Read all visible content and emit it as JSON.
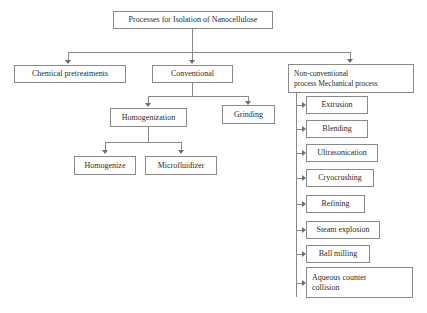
{
  "diagram": {
    "title_node": {
      "label": "Processes for Isolation of Nanocellulose"
    },
    "level2": [
      {
        "label": "Chemical pretreatments"
      },
      {
        "label": "Conventional"
      },
      {
        "label": "Non-conventional\nprocess Mechanical process"
      }
    ],
    "conventional_children": [
      {
        "label": "Homogenization"
      },
      {
        "label": "Grinding"
      }
    ],
    "homogenization_children": [
      {
        "label": "Homogenize"
      },
      {
        "label": "Microfluidizer"
      }
    ],
    "mechanical_processes": [
      {
        "label": "Extrusion"
      },
      {
        "label": "Blending"
      },
      {
        "label": "Ultrasonication"
      },
      {
        "label": "Cryocrushing"
      },
      {
        "label": "Refining"
      },
      {
        "label": "Steam explosion"
      },
      {
        "label": "Ball milling"
      },
      {
        "label": "Aqueous counter\ncollision"
      }
    ],
    "colors": {
      "box_border": "#8a8a8a",
      "connector": "#8a8a8a",
      "text": "#2b2b2b",
      "background": "#ffffff"
    }
  }
}
